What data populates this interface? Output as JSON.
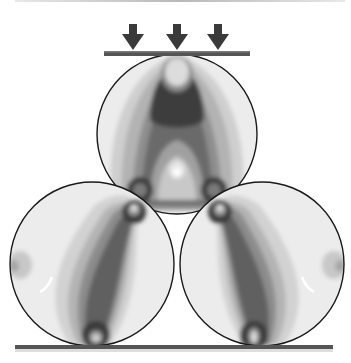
{
  "diagram": {
    "load_arrows": {
      "count": 3,
      "color": "#3a3a3a",
      "direction": "down"
    },
    "plates": [
      {
        "id": "top-plate",
        "color": "#555555"
      },
      {
        "id": "bottom-plate",
        "color": "#555555"
      }
    ],
    "discs": [
      {
        "id": "top-disc",
        "position": "top-center"
      },
      {
        "id": "bottom-left-disc",
        "position": "bottom-left"
      },
      {
        "id": "bottom-right-disc",
        "position": "bottom-right"
      }
    ],
    "contour_levels": [
      "#f2f2f2",
      "#dedede",
      "#c6c6c6",
      "#a6a6a6",
      "#858585",
      "#676767",
      "#4e4e4e",
      "#3a3a3a"
    ],
    "outline_color": "#1a1a1a"
  }
}
